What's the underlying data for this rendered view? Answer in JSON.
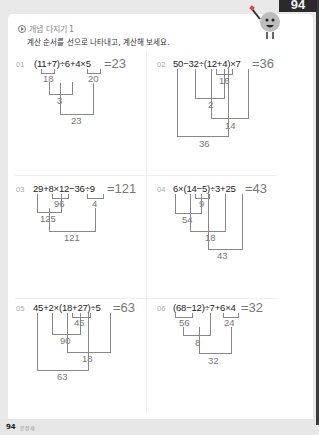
{
  "page_tab": "94",
  "section": {
    "title": "개념 다지기 1",
    "instruction": "계산 순서를 선으로 나타내고, 계산해 보세요."
  },
  "problems": [
    {
      "num": "01",
      "expr": "(11+7)÷6+4×5",
      "answer": "=23",
      "steps": [
        "18",
        "20",
        "3",
        "23"
      ]
    },
    {
      "num": "02",
      "expr": "50−32÷(12+4)×7",
      "answer": "=36",
      "steps": [
        "16",
        "2",
        "14",
        "36"
      ]
    },
    {
      "num": "03",
      "expr": "29+8×12−36÷9",
      "answer": "=121",
      "steps": [
        "96",
        "4",
        "125",
        "121"
      ]
    },
    {
      "num": "04",
      "expr": "6×(14−5)÷3+25",
      "answer": "=43",
      "steps": [
        "9",
        "54",
        "18",
        "43"
      ]
    },
    {
      "num": "05",
      "expr": "45+2×(18+27)÷5",
      "answer": "=63",
      "steps": [
        "45",
        "90",
        "18",
        "63"
      ]
    },
    {
      "num": "06",
      "expr": "(68−12)÷7+6×4",
      "answer": "=32",
      "steps": [
        "56",
        "24",
        "8",
        "32"
      ]
    }
  ],
  "footer": {
    "page": "94",
    "label": "문장제"
  }
}
